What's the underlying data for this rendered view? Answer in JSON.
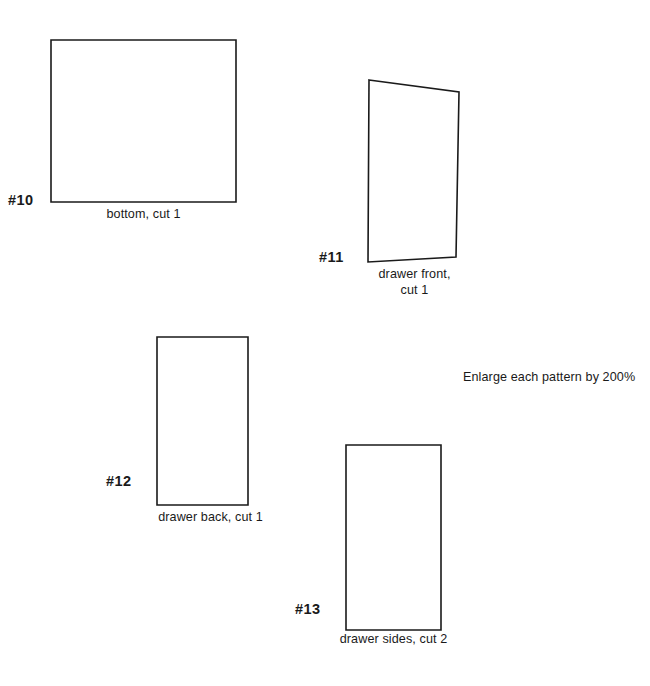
{
  "sheet": {
    "note": "Enlarge each pattern by 200%",
    "background_color": "#ffffff",
    "line_color": "#1a1a1a"
  },
  "pieces": [
    {
      "number": "#10",
      "caption_line1": "bottom, cut 1",
      "caption_line2": "",
      "shape": "rectangle",
      "cut_quantity": "1",
      "part_name": "bottom"
    },
    {
      "number": "#11",
      "caption_line1": "drawer front,",
      "caption_line2": "cut 1",
      "shape": "quadrilateral",
      "cut_quantity": "1",
      "part_name": "drawer front"
    },
    {
      "number": "#12",
      "caption_line1": "drawer back, cut 1",
      "caption_line2": "",
      "shape": "rectangle",
      "cut_quantity": "1",
      "part_name": "drawer back"
    },
    {
      "number": "#13",
      "caption_line1": "drawer sides, cut 2",
      "caption_line2": "",
      "shape": "rectangle",
      "cut_quantity": "2",
      "part_name": "drawer sides"
    }
  ]
}
